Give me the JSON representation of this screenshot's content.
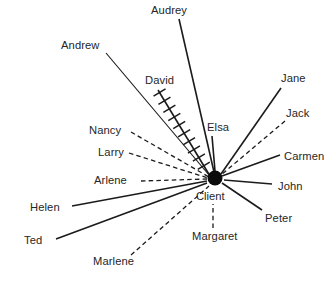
{
  "diagram": {
    "type": "sociogram",
    "title_visible": false,
    "background_color": "#ffffff",
    "line_color": "#1b1b1b",
    "hub": {
      "label": "Client",
      "marker": "filled-circle",
      "marker_color": "#0c0c0c",
      "x": 215,
      "y": 178,
      "radius": 7.5,
      "label_x": 196,
      "label_y": 200
    },
    "legend_entries": [],
    "spokes": [
      {
        "id": "audrey",
        "label": "Audrey",
        "style": "solid",
        "label_x": 151,
        "label_y": 14,
        "anchor": "start",
        "x1": 179,
        "y1": 19,
        "x2": 214,
        "y2": 172
      },
      {
        "id": "andrew",
        "label": "Andrew",
        "style": "solid-thin",
        "label_x": 61,
        "label_y": 49,
        "anchor": "start",
        "x1": 106,
        "y1": 53,
        "x2": 209,
        "y2": 175
      },
      {
        "id": "david",
        "label": "David",
        "style": "hatched",
        "label_x": 145,
        "label_y": 84,
        "anchor": "start",
        "x1": 158,
        "y1": 90,
        "x2": 210,
        "y2": 176
      },
      {
        "id": "jane",
        "label": "Jane",
        "style": "solid",
        "label_x": 281,
        "label_y": 82,
        "anchor": "start",
        "x1": 281,
        "y1": 88,
        "x2": 221,
        "y2": 174
      },
      {
        "id": "jack",
        "label": "Jack",
        "style": "dashed",
        "label_x": 286,
        "label_y": 117,
        "anchor": "start",
        "x1": 285,
        "y1": 121,
        "x2": 221,
        "y2": 175
      },
      {
        "id": "elsa",
        "label": "Elsa",
        "style": "solid",
        "label_x": 207,
        "label_y": 131,
        "anchor": "start",
        "x1": 212,
        "y1": 136,
        "x2": 215,
        "y2": 171
      },
      {
        "id": "carmen",
        "label": "Carmen",
        "style": "solid",
        "label_x": 284,
        "label_y": 160,
        "anchor": "start",
        "x1": 280,
        "y1": 155,
        "x2": 222,
        "y2": 176
      },
      {
        "id": "nancy",
        "label": "Nancy",
        "style": "dashed",
        "label_x": 89,
        "label_y": 134,
        "anchor": "start",
        "x1": 131,
        "y1": 132,
        "x2": 209,
        "y2": 177
      },
      {
        "id": "larry",
        "label": "Larry",
        "style": "dashed",
        "label_x": 98,
        "label_y": 156,
        "anchor": "start",
        "x1": 129,
        "y1": 153,
        "x2": 208,
        "y2": 178
      },
      {
        "id": "arlene",
        "label": "Arlene",
        "style": "dashed",
        "label_x": 94,
        "label_y": 184,
        "anchor": "start",
        "x1": 141,
        "y1": 181,
        "x2": 207,
        "y2": 179
      },
      {
        "id": "john",
        "label": "John",
        "style": "solid",
        "label_x": 278,
        "label_y": 190,
        "anchor": "start",
        "x1": 272,
        "y1": 184,
        "x2": 224,
        "y2": 180
      },
      {
        "id": "helen",
        "label": "Helen",
        "style": "solid",
        "label_x": 30,
        "label_y": 211,
        "anchor": "start",
        "x1": 72,
        "y1": 206,
        "x2": 207,
        "y2": 181
      },
      {
        "id": "peter",
        "label": "Peter",
        "style": "solid",
        "label_x": 265,
        "label_y": 222,
        "anchor": "start",
        "x1": 262,
        "y1": 210,
        "x2": 222,
        "y2": 183
      },
      {
        "id": "ted",
        "label": "Ted",
        "style": "solid",
        "label_x": 24,
        "label_y": 244,
        "anchor": "start",
        "x1": 56,
        "y1": 239,
        "x2": 207,
        "y2": 183
      },
      {
        "id": "margaret",
        "label": "Margaret",
        "style": "dashed",
        "label_x": 192,
        "label_y": 240,
        "anchor": "start",
        "x1": 213,
        "y1": 228,
        "x2": 213,
        "y2": 204
      },
      {
        "id": "marlene",
        "label": "Marlene",
        "style": "dashed",
        "label_x": 93,
        "label_y": 265,
        "anchor": "start",
        "x1": 131,
        "y1": 255,
        "x2": 209,
        "y2": 186
      }
    ]
  }
}
